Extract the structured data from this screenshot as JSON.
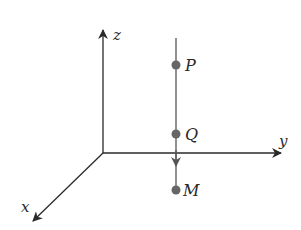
{
  "diagram": {
    "type": "3d-coordinate-axes",
    "axes": [
      {
        "name": "z",
        "label": "z",
        "direction": "up"
      },
      {
        "name": "y",
        "label": "y",
        "direction": "right"
      },
      {
        "name": "x",
        "label": "x",
        "direction": "down-left"
      }
    ],
    "vertical_line": {
      "description": "line parallel to z-axis with downward arrow"
    },
    "points": [
      {
        "label": "P",
        "position": "top"
      },
      {
        "label": "Q",
        "position": "middle, just above y-axis"
      },
      {
        "label": "M",
        "position": "bottom, below y-axis"
      }
    ],
    "colors": {
      "axis": "#2a2a2a",
      "line": "#555555",
      "point": "#666666"
    }
  }
}
